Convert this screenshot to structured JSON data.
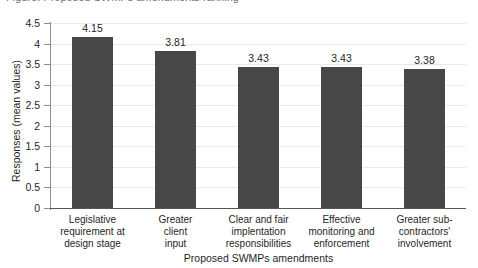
{
  "caption": {
    "partial_text": "Figure: Proposed SWMPs amendments ranking"
  },
  "chart_data": {
    "type": "bar",
    "title": "",
    "xlabel": "Proposed SWMPs amendments",
    "ylabel": "Responses (mean values)",
    "categories": [
      "Legislative requirement at design stage",
      "Greater client input",
      "Clear and fair implentation responsibilities",
      "Effective monitoring and enforcement",
      "Greater sub-contractors' involvement"
    ],
    "category_lines": [
      [
        "Legislative",
        "requirement at",
        "design stage"
      ],
      [
        "Greater",
        "client",
        "input"
      ],
      [
        "Clear and fair",
        "implentation",
        "responsibilities"
      ],
      [
        "Effective",
        "monitoring and",
        "enforcement"
      ],
      [
        "Greater sub-",
        "contractors'",
        "involvement"
      ]
    ],
    "values": [
      4.15,
      3.81,
      3.43,
      3.43,
      3.38
    ],
    "value_labels": [
      "4.15",
      "3.81",
      "3.43",
      "3.43",
      "3.38"
    ],
    "ylim": [
      0,
      4.5
    ],
    "ytick_labels": [
      "4.5",
      "4",
      "3.5",
      "3",
      "2.5",
      "2",
      "1.5",
      "1",
      "0.5",
      "0"
    ],
    "ytick_values": [
      4.5,
      4,
      3.5,
      3,
      2.5,
      2,
      1.5,
      1,
      0.5,
      0
    ],
    "grid": true,
    "legend": "none",
    "bar_color": "#474747",
    "grid_color": "#e9e9e9",
    "axis_color": "#555555"
  }
}
